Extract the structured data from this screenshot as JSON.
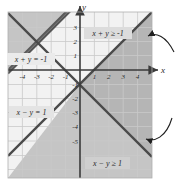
{
  "figure": {
    "type": "inequality-graph",
    "background": "#ffffff",
    "grid_color": "#c9c9c9",
    "axis_color": "#3a3a3a",
    "line_color": "#4a4a4a",
    "shade_color": "#b9b9b9",
    "text_color": "#2a2a2a"
  },
  "axes": {
    "x_label": "x",
    "y_label": "y",
    "xlim": [
      -5,
      5
    ],
    "ylim": [
      -5.5,
      4.5
    ],
    "x_ticks": [
      "-4",
      "-3",
      "-2",
      "-1",
      "1",
      "2",
      "3",
      "4"
    ],
    "x_tick_values": [
      -4,
      -3,
      -2,
      -1,
      1,
      2,
      3,
      4
    ],
    "y_ticks": [
      "3",
      "2",
      "1",
      "-1",
      "-2",
      "-3",
      "-4",
      "-5"
    ],
    "y_tick_values": [
      3,
      2,
      1,
      -1,
      -2,
      -3,
      -4,
      -5
    ],
    "grid": true
  },
  "lines": [
    {
      "id": "line-x-plus-y",
      "equation_label": "x + y = -1",
      "slope": -1,
      "intercept": -1,
      "style": "solid"
    },
    {
      "id": "line-x-minus-y",
      "equation_label": "x − y = 1",
      "slope": 1,
      "intercept": -1,
      "style": "solid"
    }
  ],
  "regions": [
    {
      "id": "region-x-plus-y",
      "inequality_label": "x + y ≥ -1",
      "shaded": true
    },
    {
      "id": "region-x-minus-y",
      "inequality_label": "x − y ≥ 1",
      "shaded": true
    }
  ],
  "annotations": {
    "arrows": [
      {
        "id": "arrow-upper",
        "direction": "left",
        "curved": true
      },
      {
        "id": "arrow-lower",
        "direction": "left",
        "curved": true
      }
    ]
  },
  "labels": {
    "line_eq_upper_left": "x + y = -1",
    "line_eq_lower_left": "x − y = 1",
    "ineq_upper": "x + y ≥ -1",
    "ineq_lower": "x − y ≥ 1"
  }
}
